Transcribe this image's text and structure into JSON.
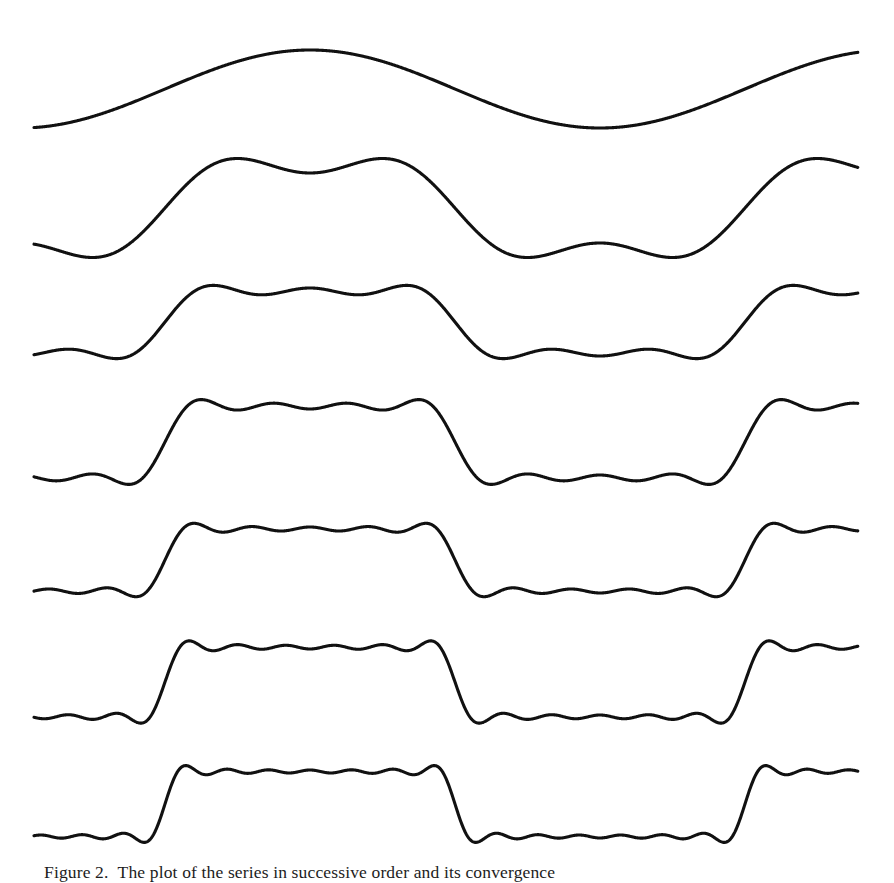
{
  "figure": {
    "caption_label": "Figure 2.",
    "caption_text": "The plot of the series in successive order and its convergence",
    "caption_full": "Figure 2.  The plot of the series in successive order and its convergence",
    "background_color": "#ffffff",
    "stroke_color": "#111111"
  },
  "chart_data": {
    "type": "line",
    "title": "",
    "subtitle": "",
    "xlabel": "",
    "ylabel": "",
    "grid": false,
    "legend": null,
    "axes_visible": false,
    "tick_labels": [],
    "x_range": [
      0,
      1.42
    ],
    "x_pixel_range": [
      34,
      858
    ],
    "wave_period_px": 580,
    "wave_phase_zero_px": 165,
    "series": [
      {
        "name": "n = 1 (fundamental)",
        "terms": 1,
        "harmonics": [
          1
        ],
        "amplitude_px": 39,
        "midline_px": 89,
        "row": 1
      },
      {
        "name": "n = 2 (1st + 3rd)",
        "terms": 2,
        "harmonics": [
          1,
          3
        ],
        "amplitude_px": 35,
        "midline_px": 208,
        "row": 2
      },
      {
        "name": "n = 3 (1st + 3rd + 5th)",
        "terms": 3,
        "harmonics": [
          1,
          3,
          5
        ],
        "amplitude_px": 34,
        "midline_px": 322,
        "row": 3
      },
      {
        "name": "n = 4 (through 7th)",
        "terms": 4,
        "harmonics": [
          1,
          3,
          5,
          7
        ],
        "amplitude_px": 33,
        "midline_px": 442,
        "row": 4
      },
      {
        "name": "n = 5 (through 9th)",
        "terms": 5,
        "harmonics": [
          1,
          3,
          5,
          7,
          9
        ],
        "amplitude_px": 33,
        "midline_px": 560,
        "row": 5
      },
      {
        "name": "n = 6 (through 11th)",
        "terms": 6,
        "harmonics": [
          1,
          3,
          5,
          7,
          9,
          11
        ],
        "amplitude_px": 33,
        "midline_px": 682,
        "row": 6
      },
      {
        "name": "n = 7 (through 13th)",
        "terms": 7,
        "harmonics": [
          1,
          3,
          5,
          7,
          9,
          11,
          13
        ],
        "amplitude_px": 34,
        "midline_px": 804,
        "row": 7
      }
    ]
  }
}
